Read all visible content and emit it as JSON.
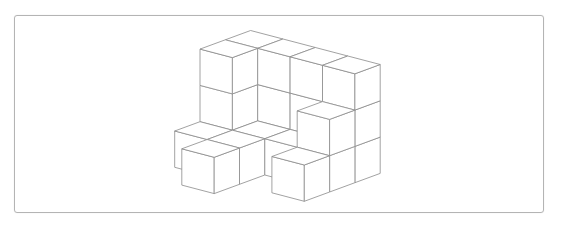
{
  "figure": {
    "line_color": "#8a8a8a",
    "face_color": "#ffffff",
    "frame_color": "#b4b4b4",
    "cube_count": 22,
    "columns": [
      {
        "row": 0,
        "col": 0,
        "height": 3
      },
      {
        "row": 0,
        "col": 1,
        "height": 3
      },
      {
        "row": 1,
        "col": 1,
        "height": 3
      },
      {
        "row": 2,
        "col": 1,
        "height": 3
      },
      {
        "row": 3,
        "col": 1,
        "height": 3
      },
      {
        "row": 3,
        "col": 0,
        "height": 2
      },
      {
        "row": 1,
        "col": 0,
        "height": 1
      },
      {
        "row": 2,
        "col": 0,
        "height": 1
      },
      {
        "row": 0,
        "col": -1,
        "height": 1
      },
      {
        "row": 1,
        "col": -1,
        "height": 1
      },
      {
        "row": 1,
        "col": -2,
        "height": 1
      },
      {
        "row": 3,
        "col": -1,
        "height": 1
      }
    ]
  }
}
